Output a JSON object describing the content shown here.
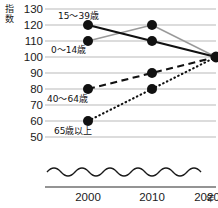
{
  "chart_data": {
    "type": "line",
    "title": "",
    "subtitle": "",
    "xlabel": "年",
    "ylabel": "指数",
    "x": [
      "2000",
      "2010",
      "2020"
    ],
    "categories": [
      "2000",
      "2010",
      "2020"
    ],
    "ylim": [
      50,
      130
    ],
    "yticks": [
      130,
      120,
      110,
      100,
      90,
      80,
      70,
      60,
      50
    ],
    "ytick_labels": [
      "130",
      "120",
      "110",
      "100",
      "90",
      "80",
      "70",
      "60",
      "50"
    ],
    "grid": true,
    "axis_break": true,
    "axis_break_style": "wavy",
    "legend": "inline-labels",
    "markers": "filled-circle",
    "series": [
      {
        "name": "0～14歳",
        "values": [
          120,
          110,
          100
        ],
        "style": "solid",
        "color": "#111111",
        "width": 2.2,
        "label_x": "2000",
        "label_anchor_value": 110
      },
      {
        "name": "15～39歳",
        "values": [
          110,
          120,
          100
        ],
        "style": "solid",
        "color": "#9a9a9a",
        "width": 1.3,
        "label_x": "2000",
        "label_anchor_value": 120
      },
      {
        "name": "40～64歳",
        "values": [
          80,
          90,
          100
        ],
        "style": "dashed",
        "color": "#111111",
        "width": 2.0,
        "label_x": "2000",
        "label_anchor_value": 75
      },
      {
        "name": "65歳以上",
        "values": [
          60,
          80,
          100
        ],
        "style": "dotted",
        "color": "#111111",
        "width": 2.0,
        "label_x": "2000",
        "label_anchor_value": 55
      }
    ]
  },
  "axis": {
    "y_title": "指数",
    "x_unit": "年",
    "y_tick_130": "130",
    "y_tick_120": "120",
    "y_tick_110": "110",
    "y_tick_100": "100",
    "y_tick_90": "90",
    "y_tick_80": "80",
    "y_tick_70": "70",
    "y_tick_60": "60",
    "y_tick_50": "50",
    "x_tick_2000": "2000",
    "x_tick_2010": "2010",
    "x_tick_2020": "2020"
  },
  "labels": {
    "series_0_14": "0～14歳",
    "series_15_39": "15～39歳",
    "series_40_64": "40～64歳",
    "series_65_up": "65歳以上"
  },
  "colors": {
    "line_dark": "#111111",
    "line_gray": "#9a9a9a",
    "gridline": "#b9b9b9",
    "axis": "#2a2a2a",
    "background": "#ffffff"
  }
}
